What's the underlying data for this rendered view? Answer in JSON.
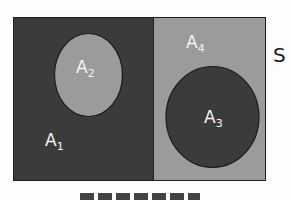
{
  "diagram": {
    "type": "venn-partition",
    "universe_label": "S",
    "colors": {
      "dark": "#3b3b3b",
      "light": "#9b9b9b",
      "outline": "#1e1e1e",
      "label_light": "#f4f4f4",
      "label_dark": "#1a1a1a"
    },
    "regions": [
      {
        "name": "A",
        "sub": "1",
        "description": "left dark half minus A2"
      },
      {
        "name": "A",
        "sub": "2",
        "description": "light ellipse inside left half"
      },
      {
        "name": "A",
        "sub": "3",
        "description": "dark circle inside right half"
      },
      {
        "name": "A",
        "sub": "4",
        "description": "right light half minus A3"
      }
    ],
    "caption_partial": "(cropped caption text at bottom)"
  }
}
